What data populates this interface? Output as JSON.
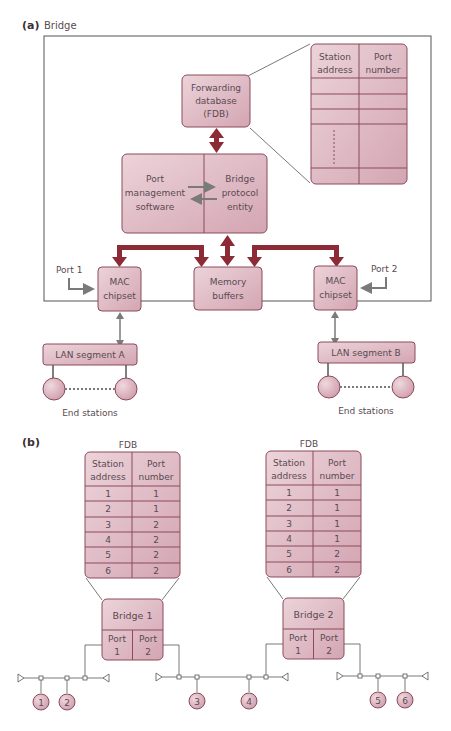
{
  "colors": {
    "box_fill": "#dcb3be",
    "box_fill_light": "#ecd3da",
    "box_stroke": "#8c4a5c",
    "thick_arrow": "#8c2a35",
    "gray_arrow": "#7a7a7a",
    "frame": "#555555",
    "text": "#5a4a52"
  },
  "panel_a": {
    "tag": "(a)",
    "title": "Bridge",
    "fdb_box": [
      "Forwarding",
      "database",
      "(FDB)"
    ],
    "fdb_table": {
      "headers": [
        [
          "Station",
          "address"
        ],
        [
          "Port",
          "number"
        ]
      ]
    },
    "protocol_box": {
      "left": [
        "Port",
        "management",
        "software"
      ],
      "right": [
        "Bridge",
        "protocol",
        "entity"
      ]
    },
    "mac_left": [
      "MAC",
      "chipset"
    ],
    "mac_right": [
      "MAC",
      "chipset"
    ],
    "memory": [
      "Memory",
      "buffers"
    ],
    "port1": "Port 1",
    "port2": "Port 2",
    "lan_a": "LAN segment A",
    "lan_b": "LAN segment B",
    "end_stations_a": "End stations",
    "end_stations_b": "End stations"
  },
  "panel_b": {
    "tag": "(b)",
    "fdb1": {
      "title": "FDB",
      "headers": [
        [
          "Station",
          "address"
        ],
        [
          "Port",
          "number"
        ]
      ],
      "rows": [
        [
          "1",
          "1"
        ],
        [
          "2",
          "1"
        ],
        [
          "3",
          "2"
        ],
        [
          "4",
          "2"
        ],
        [
          "5",
          "2"
        ],
        [
          "6",
          "2"
        ]
      ]
    },
    "fdb2": {
      "title": "FDB",
      "headers": [
        [
          "Station",
          "address"
        ],
        [
          "Port",
          "number"
        ]
      ],
      "rows": [
        [
          "1",
          "1"
        ],
        [
          "2",
          "1"
        ],
        [
          "3",
          "1"
        ],
        [
          "4",
          "1"
        ],
        [
          "5",
          "2"
        ],
        [
          "6",
          "2"
        ]
      ]
    },
    "bridge1": {
      "name": "Bridge 1",
      "ports": [
        [
          "Port",
          "1"
        ],
        [
          "Port",
          "2"
        ]
      ]
    },
    "bridge2": {
      "name": "Bridge 2",
      "ports": [
        [
          "Port",
          "1"
        ],
        [
          "Port",
          "2"
        ]
      ]
    },
    "stations": [
      "1",
      "2",
      "3",
      "4",
      "5",
      "6"
    ]
  }
}
